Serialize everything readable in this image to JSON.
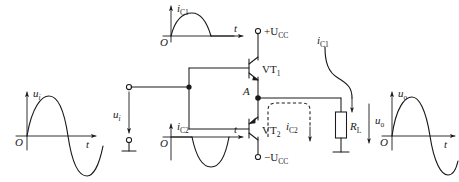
{
  "figure": {
    "ink_color": "#1a1a1a",
    "background": "#ffffff"
  },
  "waveforms": {
    "input": {
      "name": "input-waveform",
      "y_label": "u",
      "y_label_sub": "i",
      "x_label": "t",
      "origin_label": "O",
      "shape": "full-sine",
      "description": "one full sine cycle, positive half first"
    },
    "ic1": {
      "name": "ic1-waveform",
      "y_label": "i",
      "y_label_sub": "C1",
      "x_label": "t",
      "origin_label": "O",
      "shape": "positive-half-sine",
      "description": "positive half sine then flat along axis"
    },
    "ic2": {
      "name": "ic2-waveform",
      "y_label": "i",
      "y_label_sub": "C2",
      "x_label": "t",
      "origin_label": "O",
      "shape": "negative-half-sine",
      "description": "flat along axis then negative half sine"
    },
    "output": {
      "name": "output-waveform",
      "y_label": "u",
      "y_label_sub": "o",
      "x_label": "t",
      "origin_label": "O",
      "shape": "full-sine",
      "description": "one full sine cycle, positive half first"
    }
  },
  "circuit": {
    "input_source_label": "u",
    "input_source_sub": "i",
    "supply_positive": "+U",
    "supply_positive_sub": "CC",
    "supply_negative": "−U",
    "supply_negative_sub": "CC",
    "transistor_top": "VT",
    "transistor_top_sub": "1",
    "transistor_bottom": "VT",
    "transistor_bottom_sub": "2",
    "node_label": "A",
    "load_label": "R",
    "load_sub": "L",
    "output_label": "u",
    "output_sub": "o",
    "current_top": "i",
    "current_top_sub": "C1",
    "current_bottom": "i",
    "current_bottom_sub": "C2"
  }
}
